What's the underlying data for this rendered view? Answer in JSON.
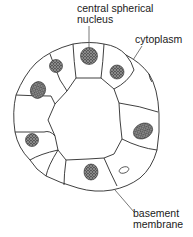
{
  "diagram": {
    "type": "cross-section of glandular acinus (epithelial cells around lumen)",
    "labels": {
      "nucleus_line1": "central spherical",
      "nucleus_line2": "nucleus",
      "cytoplasm": "cytoplasm",
      "basement_line1": "basement",
      "basement_line2": "membrane"
    },
    "colors": {
      "stroke": "#2a2a2a",
      "nucleus_fill": "#3a3a3a",
      "background": "#ffffff"
    },
    "cell_count": 9
  }
}
